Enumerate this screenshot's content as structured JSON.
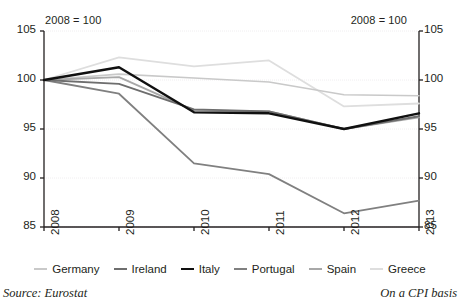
{
  "notes": {
    "left": "2008 = 100",
    "right": "2008 = 100"
  },
  "footer": {
    "source": "Source: Eurostat",
    "basis": "On a CPI basis"
  },
  "legend": {
    "position": "bottom-center",
    "entries": [
      {
        "label": "Germany",
        "color": "#c9c9c9"
      },
      {
        "label": "Ireland",
        "color": "#6e6e6e"
      },
      {
        "label": "Italy",
        "color": "#101010"
      },
      {
        "label": "Portugal",
        "color": "#808080"
      },
      {
        "label": "Spain",
        "color": "#a8a8a8"
      },
      {
        "label": "Greece",
        "color": "#dedede"
      }
    ]
  },
  "axes": {
    "y_ticks": [
      "105",
      "100",
      "95",
      "90",
      "85"
    ],
    "y_ticks_right": [
      "105",
      "100",
      "95",
      "90",
      "85"
    ],
    "x_ticks": [
      "2008",
      "2009",
      "2010",
      "2011",
      "2012",
      "2013"
    ]
  },
  "chart_data": {
    "type": "line",
    "title": "",
    "subtitle": "",
    "xlabel": "",
    "ylabel": "",
    "annotation_left": "2008 = 100",
    "annotation_right": "2008 = 100",
    "source": "Source: Eurostat",
    "note": "On a CPI basis",
    "grid": true,
    "legend_position": "bottom-center",
    "ylim": [
      85,
      105
    ],
    "yticks": [
      85,
      90,
      95,
      100,
      105
    ],
    "x": [
      2008,
      2009,
      2010,
      2011,
      2012,
      2013
    ],
    "categories": [
      "2008",
      "2009",
      "2010",
      "2011",
      "2012",
      "2013"
    ],
    "series": [
      {
        "name": "Germany",
        "color": "#c9c9c9",
        "width": 1.6,
        "values": [
          100.0,
          100.6,
          100.2,
          99.8,
          98.5,
          98.4
        ]
      },
      {
        "name": "Ireland",
        "color": "#6e6e6e",
        "width": 1.8,
        "values": [
          100.0,
          99.6,
          97.0,
          96.8,
          95.0,
          96.3
        ]
      },
      {
        "name": "Italy",
        "color": "#101010",
        "width": 2.4,
        "values": [
          100.0,
          101.3,
          96.7,
          96.6,
          95.0,
          96.6
        ]
      },
      {
        "name": "Portugal",
        "color": "#808080",
        "width": 1.8,
        "values": [
          100.0,
          98.6,
          91.5,
          90.4,
          86.4,
          87.7
        ]
      },
      {
        "name": "Spain",
        "color": "#a8a8a8",
        "width": 1.8,
        "values": [
          100.0,
          100.3,
          96.9,
          96.8,
          95.0,
          96.2
        ]
      },
      {
        "name": "Greece",
        "color": "#dedede",
        "width": 1.8,
        "values": [
          100.0,
          102.3,
          101.4,
          102.0,
          97.3,
          97.6
        ]
      }
    ]
  }
}
